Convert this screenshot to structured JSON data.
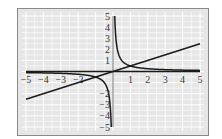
{
  "chart_data": {
    "type": "line",
    "title": "",
    "xlabel": "",
    "ylabel": "",
    "xlim": [
      -5,
      5
    ],
    "ylim": [
      -5,
      5
    ],
    "grid": true,
    "grid_step": 0.5,
    "xticks": [
      -5,
      -4,
      -3,
      -2,
      -1,
      1,
      2,
      3,
      4,
      5
    ],
    "xtick_labels": [
      "−5",
      "−4",
      "−3",
      "−2",
      "",
      "1",
      "2",
      "3",
      "4",
      "5"
    ],
    "yticks": [
      5,
      4,
      3,
      2,
      1,
      -2,
      -3,
      -4,
      -5
    ],
    "ytick_labels": [
      "5",
      "4",
      "3",
      "2",
      "1",
      "−2",
      "−3",
      "−4",
      "−5"
    ],
    "series": [
      {
        "name": "y = x/2",
        "expression": "x/2",
        "x": [
          -5,
          5
        ],
        "y": [
          -2.5,
          2.5
        ]
      },
      {
        "name": "y = 1/(2x)",
        "expression": "1/(2x)",
        "x": [
          -5,
          -2,
          -1,
          -0.5,
          -0.1,
          0.1,
          0.5,
          1,
          2,
          5
        ],
        "y": [
          -0.1,
          -0.25,
          -0.5,
          -1,
          -5,
          5,
          1,
          0.5,
          0.25,
          0.1
        ]
      }
    ],
    "intersections": [
      [
        1,
        0.5
      ],
      [
        -1,
        -0.5
      ]
    ],
    "colors": {
      "background": "#e6e6e6",
      "grid": "#ffffff",
      "curve": "#1a1a1a",
      "frame": "#8a8a8a"
    }
  }
}
